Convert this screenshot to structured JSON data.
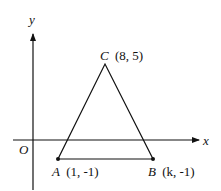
{
  "diagram": {
    "axes": {
      "x_label": "x",
      "y_label": "y",
      "origin_label": "O"
    },
    "points": [
      {
        "id": "A",
        "name": "A",
        "coords": "(1, -1)",
        "x": 1,
        "y": -1
      },
      {
        "id": "B",
        "name": "B",
        "coords": "(k, -1)",
        "x": "k",
        "y": -1
      },
      {
        "id": "C",
        "name": "C",
        "coords": "(8, 5)",
        "x": 8,
        "y": 5
      }
    ],
    "shape": "triangle ABC",
    "colors": {
      "stroke": "#111111",
      "background": "#ffffff"
    }
  }
}
